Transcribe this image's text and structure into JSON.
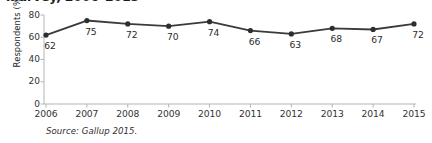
{
  "title": {
    "cropped_text": "…urvey, 2006–2015"
  },
  "source_note": "Source: Gallup 2015.",
  "chart_data": {
    "type": "line",
    "title": "",
    "xlabel": "",
    "ylabel": "Respondents (%)",
    "categories": [
      "2006",
      "2007",
      "2008",
      "2009",
      "2010",
      "2011",
      "2012",
      "2013",
      "2014",
      "2015"
    ],
    "values": [
      62,
      75,
      72,
      70,
      74,
      66,
      63,
      68,
      67,
      72
    ],
    "value_labels": [
      "62",
      "75",
      "72",
      "70",
      "74",
      "66",
      "63",
      "68",
      "67",
      "72"
    ],
    "ylim": [
      0,
      80
    ],
    "yticks": [
      80,
      60,
      40,
      20,
      0
    ],
    "ytick_labels": [
      "80",
      "60",
      "40",
      "20",
      "0"
    ],
    "grid": false,
    "legend": "none",
    "markers": "circle",
    "line_color": "#3b3b3b",
    "marker_color": "#2e2e2e",
    "axis_color": "#b5b5b5",
    "background_color": "#ffffff"
  }
}
